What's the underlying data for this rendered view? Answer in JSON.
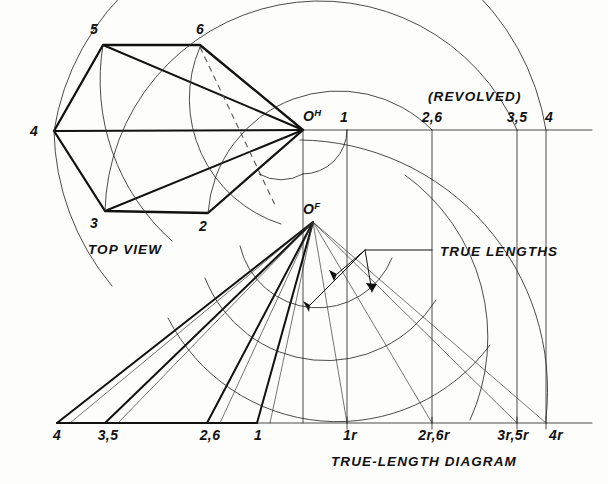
{
  "drawing": {
    "title": "True-Length Diagram",
    "captions": {
      "top_view": "TOP VIEW",
      "revolved": "(REVOLVED)",
      "true_lengths": "TRUE LENGTHS",
      "true_length_diagram": "TRUE-LENGTH DIAGRAM"
    },
    "apex": {
      "top_label_base": "O",
      "top_label_sup": "H",
      "front_label_base": "O",
      "front_label_sup": "F"
    },
    "top_view_vertices": [
      {
        "label": "4",
        "x": 54,
        "y": 131
      },
      {
        "label": "5",
        "x": 103,
        "y": 45
      },
      {
        "label": "6",
        "x": 200,
        "y": 45
      },
      {
        "label": "3",
        "x": 105,
        "y": 211
      },
      {
        "label": "2",
        "x": 208,
        "y": 213
      }
    ],
    "top_view_vertex_labels": [
      {
        "label": "5",
        "x": 90,
        "y": 34
      },
      {
        "label": "6",
        "x": 196,
        "y": 34
      },
      {
        "label": "4",
        "x": 33,
        "y": 136
      },
      {
        "label": "3",
        "x": 92,
        "y": 227
      },
      {
        "label": "2",
        "x": 199,
        "y": 230
      }
    ],
    "horizon": {
      "y": 130,
      "x_start": 54,
      "x_end": 592
    },
    "revolved_stations": [
      {
        "label": "1",
        "x": 347
      },
      {
        "label": "2,6",
        "x": 432
      },
      {
        "label": "3,5",
        "x": 517
      },
      {
        "label": "4",
        "x": 546
      }
    ],
    "revolved_station_label_y": 122,
    "baseline": {
      "y": 423,
      "x_start": 43,
      "x_end": 592
    },
    "base_left_stations": [
      {
        "label": "4",
        "x": 57
      },
      {
        "label": "3,5",
        "x": 105
      },
      {
        "label": "2,6",
        "x": 207
      },
      {
        "label": "1",
        "x": 257
      }
    ],
    "base_right_stations": [
      {
        "label": "1r",
        "x": 347
      },
      {
        "label": "2r,6r",
        "x": 432
      },
      {
        "label": "3r,5r",
        "x": 517
      },
      {
        "label": "4r",
        "x": 546
      }
    ],
    "base_label_y": 440,
    "diagram_caption_pos": {
      "x": 331,
      "y": 465
    },
    "revolved_caption_pos": {
      "x": 428,
      "y": 101
    },
    "top_view_caption_pos": {
      "x": 88,
      "y": 253
    },
    "true_lengths_caption_pos": {
      "x": 438,
      "y": 256
    },
    "colors": {
      "ink": "#111111",
      "thin_ink": "#2a2a2a",
      "hidden": "#555555",
      "paper": "#fdfdfc"
    }
  }
}
